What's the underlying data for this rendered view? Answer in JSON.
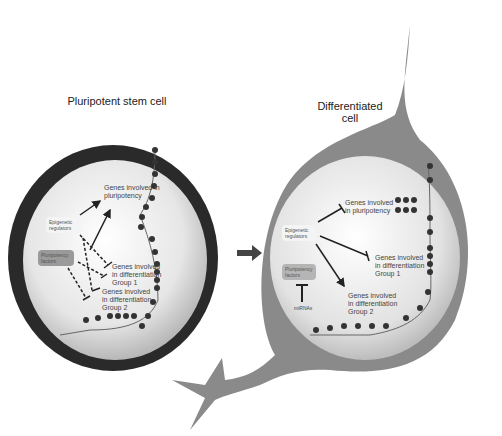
{
  "left_cell": {
    "title": "Pluripotent stem cell",
    "epigenetic": "Epigenetic regulators",
    "pluripotency_factors": "Pluripotency factors",
    "genes_pluri": "Genes involved in pluripotency",
    "genes_g1": "Genes involved in differentiation Group 1",
    "genes_g2": "Genes involved in differentiation Group 2"
  },
  "right_cell": {
    "title_line1": "Differentiated",
    "title_line2": "cell",
    "epigenetic": "Epigenetic regulators",
    "pluripotency_factors": "Pluripotency factors",
    "mirnas": "miRNAs",
    "genes_pluri": "Genes involved in pluripotency",
    "genes_g1": "Genes involved in differentiation Group 1",
    "genes_g2": "Genes involved in differentiation Group 2"
  },
  "colors": {
    "stem_membrane": "#2a2a2a",
    "diff_membrane": "#8a8a8a",
    "neuron_process": "#3a3a3a",
    "arrow": "#555555",
    "label_box_grey": "#9a9a9a"
  }
}
